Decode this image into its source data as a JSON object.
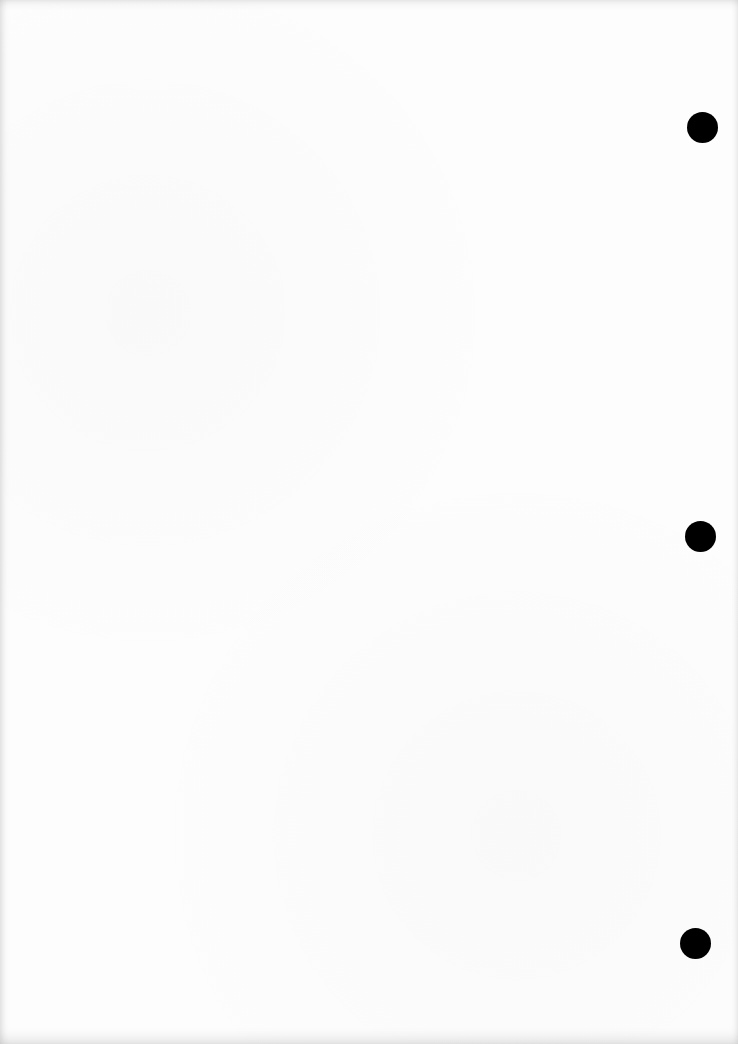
{
  "document": {
    "type": "blank scanned page",
    "background_color": "#fdfdfd",
    "text_content": "",
    "punch_holes": [
      {
        "cx": 702,
        "cy": 127,
        "r": 15,
        "color": "#000000"
      },
      {
        "cx": 700,
        "cy": 536,
        "r": 15,
        "color": "#000000"
      },
      {
        "cx": 695,
        "cy": 943,
        "r": 15,
        "color": "#000000"
      }
    ]
  }
}
